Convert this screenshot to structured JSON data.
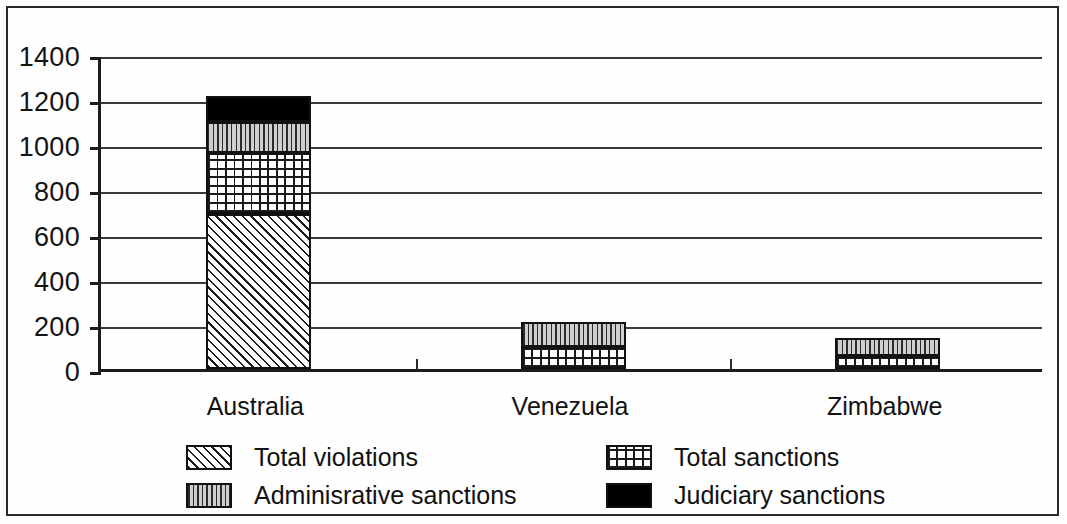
{
  "chart_data": {
    "type": "bar",
    "subtype": "stacked-bar",
    "title": "",
    "xlabel": "",
    "ylabel": "",
    "ylim": [
      0,
      1400
    ],
    "ytick_step": 200,
    "ytick_labels": [
      "1400",
      "1200",
      "1000",
      "800",
      "600",
      "400",
      "200",
      "0"
    ],
    "ytick_values": [
      1400,
      1200,
      1000,
      800,
      600,
      400,
      200,
      0
    ],
    "grid": true,
    "grid_axis": "y",
    "legend_position": "bottom",
    "categories": [
      "Australia",
      "Venezuela",
      "Zimbabwe"
    ],
    "series": [
      {
        "name": "Total violations",
        "pattern": "diagonal-hatch",
        "values": [
          690,
          0,
          0
        ]
      },
      {
        "name": "Total sanctions",
        "pattern": "cross-hatch-grid",
        "values": [
          270,
          100,
          60
        ]
      },
      {
        "name": "Adminisrative sanctions",
        "pattern": "vertical-lines",
        "values": [
          140,
          110,
          80
        ]
      },
      {
        "name": "Judiciary sanctions",
        "pattern": "solid-black",
        "values": [
          115,
          0,
          0
        ]
      }
    ],
    "cumulative_tops": {
      "Australia": [
        690,
        960,
        1100,
        1215
      ],
      "Venezuela": [
        0,
        100,
        210,
        210
      ],
      "Zimbabwe": [
        0,
        60,
        140,
        140
      ]
    }
  },
  "legend": {
    "entries": [
      {
        "label": "Total violations",
        "pattern": "diagonal-hatch"
      },
      {
        "label": "Total sanctions",
        "pattern": "cross-hatch-grid"
      },
      {
        "label": "Adminisrative sanctions",
        "pattern": "vertical-lines"
      },
      {
        "label": "Judiciary sanctions",
        "pattern": "solid-black"
      }
    ]
  },
  "colors": {
    "axis": "#1c1c1c",
    "gridline": "#3a3a3a",
    "text": "#121212",
    "judiciary_fill": "#000000",
    "administrative_fill": "#cfcfcf",
    "background": "#fefefe"
  }
}
